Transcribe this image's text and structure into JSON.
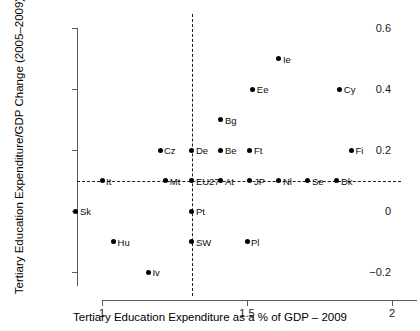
{
  "chart_data": {
    "type": "scatter",
    "title": "",
    "xlabel": "Tertiary Education Expenditure as a % of GDP – 2009",
    "ylabel": "Tertiary Education Expenditure/GDP Change (2005–2009)",
    "xlim": [
      0.86,
      1.95
    ],
    "ylim": [
      -0.235,
      0.645
    ],
    "grid": false,
    "legend": null,
    "xticks": [
      {
        "value": 1,
        "label": "1"
      },
      {
        "value": 1.5,
        "label": "1.5"
      },
      {
        "value": 2,
        "label": "2"
      }
    ],
    "yticks": [
      {
        "value": 0.6,
        "label": "0.6"
      },
      {
        "value": 0.4,
        "label": "0.4"
      },
      {
        "value": 0.2,
        "label": "0.2"
      },
      {
        "value": 0,
        "label": "0"
      },
      {
        "value": -0.2,
        "label": "−0.2"
      }
    ],
    "reference_lines": [
      {
        "orientation": "horizontal",
        "value": 0.1,
        "style": "dashed"
      },
      {
        "orientation": "vertical",
        "value": 1.31,
        "style": "dashed"
      }
    ],
    "points": [
      {
        "label": "Ie",
        "x": 1.61,
        "y": 0.5
      },
      {
        "label": "Ee",
        "x": 1.52,
        "y": 0.4
      },
      {
        "label": "Cy",
        "x": 1.82,
        "y": 0.4
      },
      {
        "label": "Bg",
        "x": 1.41,
        "y": 0.3
      },
      {
        "label": "Cz",
        "x": 1.2,
        "y": 0.2
      },
      {
        "label": "De",
        "x": 1.31,
        "y": 0.2
      },
      {
        "label": "Be",
        "x": 1.41,
        "y": 0.2
      },
      {
        "label": "Ft",
        "x": 1.51,
        "y": 0.2
      },
      {
        "label": "Fi",
        "x": 1.86,
        "y": 0.2
      },
      {
        "label": "It",
        "x": 1.0,
        "y": 0.1
      },
      {
        "label": "Mt",
        "x": 1.22,
        "y": 0.1
      },
      {
        "label": "EU27",
        "x": 1.31,
        "y": 0.1
      },
      {
        "label": "At",
        "x": 1.41,
        "y": 0.1
      },
      {
        "label": "JP",
        "x": 1.51,
        "y": 0.1
      },
      {
        "label": "Nl",
        "x": 1.61,
        "y": 0.1
      },
      {
        "label": "Se",
        "x": 1.71,
        "y": 0.1
      },
      {
        "label": "Dk",
        "x": 1.81,
        "y": 0.1
      },
      {
        "label": "Sk",
        "x": 0.91,
        "y": 0.0
      },
      {
        "label": "Pt",
        "x": 1.31,
        "y": 0.0
      },
      {
        "label": "Hu",
        "x": 1.04,
        "y": -0.1
      },
      {
        "label": "SW",
        "x": 1.31,
        "y": -0.1
      },
      {
        "label": "Pl",
        "x": 1.5,
        "y": -0.1
      },
      {
        "label": "Iv",
        "x": 1.16,
        "y": -0.2
      }
    ]
  }
}
